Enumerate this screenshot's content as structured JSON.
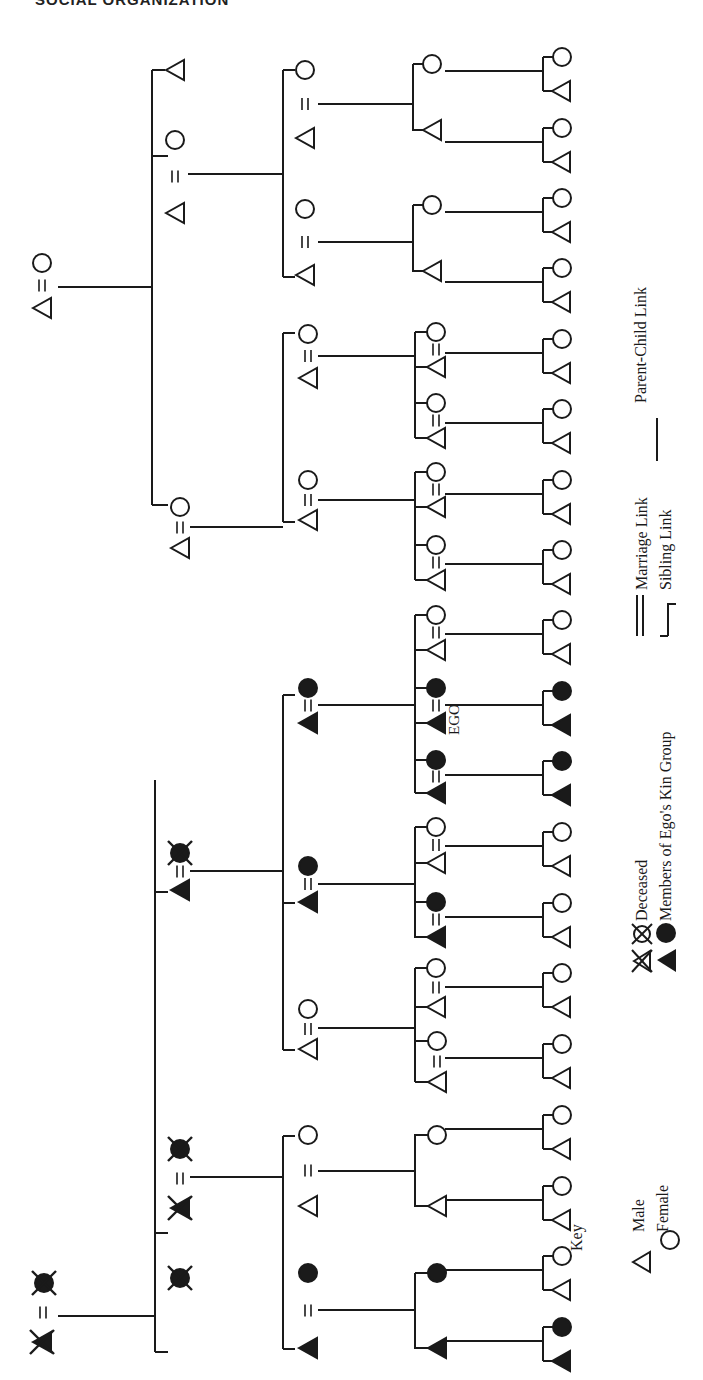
{
  "header": {
    "title": "SOCIAL ORGANIZATION"
  },
  "colors": {
    "ink": "#1a1a1a",
    "paper": "#ffffff"
  },
  "figure": {
    "orientation": "rotated-90-ccw",
    "ego_label": "EGO",
    "links": {
      "marriage": "=",
      "sibling": "bracket",
      "parent_child": "line"
    }
  },
  "legend": {
    "key_label": "Key",
    "male_label": "Male",
    "female_label": "Female",
    "deceased_label": "Deceased",
    "kin_group_label": "Members of Ego's Kin Group",
    "marriage_link_label": "Marriage Link",
    "sibling_link_label": "Sibling Link",
    "parent_child_link_label": "Parent-Child Link"
  },
  "nodes": [
    {
      "id": "g0a-m",
      "x": 42,
      "y": 1342,
      "shape": "triangle",
      "filled": true,
      "deceased": true
    },
    {
      "id": "g0a-f",
      "x": 44,
      "y": 1283,
      "shape": "circle",
      "filled": true,
      "deceased": true
    },
    {
      "id": "g0b-m",
      "x": 42,
      "y": 308,
      "shape": "triangle",
      "filled": false,
      "deceased": false
    },
    {
      "id": "g0b-f",
      "x": 42,
      "y": 263,
      "shape": "circle",
      "filled": false,
      "deceased": false
    },
    {
      "id": "g1-1",
      "x": 180,
      "y": 1278,
      "shape": "circle",
      "filled": true,
      "deceased": true
    },
    {
      "id": "g1-2m",
      "x": 180,
      "y": 1208,
      "shape": "triangle",
      "filled": true,
      "deceased": true
    },
    {
      "id": "g1-2f",
      "x": 180,
      "y": 1149,
      "shape": "circle",
      "filled": true,
      "deceased": true
    },
    {
      "id": "g1-3m",
      "x": 180,
      "y": 890,
      "shape": "triangle",
      "filled": true,
      "deceased": false
    },
    {
      "id": "g1-3f",
      "x": 180,
      "y": 853,
      "shape": "circle",
      "filled": true,
      "deceased": true
    },
    {
      "id": "g1-4m",
      "x": 180,
      "y": 548,
      "shape": "triangle",
      "filled": false,
      "deceased": false
    },
    {
      "id": "g1-4f",
      "x": 180,
      "y": 507,
      "shape": "circle",
      "filled": false,
      "deceased": false
    },
    {
      "id": "g1-5m",
      "x": 175,
      "y": 213,
      "shape": "triangle",
      "filled": false,
      "deceased": false
    },
    {
      "id": "g1-5f",
      "x": 175,
      "y": 140,
      "shape": "circle",
      "filled": false,
      "deceased": false
    },
    {
      "id": "g1-6",
      "x": 175,
      "y": 70,
      "shape": "triangle",
      "filled": false,
      "deceased": false
    },
    {
      "id": "g2-1m",
      "x": 308,
      "y": 1348,
      "shape": "triangle",
      "filled": true,
      "deceased": false
    },
    {
      "id": "g2-1f",
      "x": 308,
      "y": 1273,
      "shape": "circle",
      "filled": true,
      "deceased": false
    },
    {
      "id": "g2-2m",
      "x": 308,
      "y": 1206,
      "shape": "triangle",
      "filled": false,
      "deceased": false
    },
    {
      "id": "g2-2f",
      "x": 308,
      "y": 1135,
      "shape": "circle",
      "filled": false,
      "deceased": false
    },
    {
      "id": "g2-3m",
      "x": 308,
      "y": 1049,
      "shape": "triangle",
      "filled": false,
      "deceased": false
    },
    {
      "id": "g2-3f",
      "x": 308,
      "y": 1009,
      "shape": "circle",
      "filled": false,
      "deceased": false
    },
    {
      "id": "g2-4m",
      "x": 308,
      "y": 902,
      "shape": "triangle",
      "filled": true,
      "deceased": false
    },
    {
      "id": "g2-4f",
      "x": 308,
      "y": 866,
      "shape": "circle",
      "filled": true,
      "deceased": false
    },
    {
      "id": "g2-5m",
      "x": 308,
      "y": 723,
      "shape": "triangle",
      "filled": true,
      "deceased": false
    },
    {
      "id": "g2-5f",
      "x": 308,
      "y": 688,
      "shape": "circle",
      "filled": true,
      "deceased": false
    },
    {
      "id": "g2-6m",
      "x": 308,
      "y": 520,
      "shape": "triangle",
      "filled": false,
      "deceased": false
    },
    {
      "id": "g2-6f",
      "x": 308,
      "y": 480,
      "shape": "circle",
      "filled": false,
      "deceased": false
    },
    {
      "id": "g2-7m",
      "x": 308,
      "y": 378,
      "shape": "triangle",
      "filled": false,
      "deceased": false
    },
    {
      "id": "g2-7f",
      "x": 308,
      "y": 334,
      "shape": "circle",
      "filled": false,
      "deceased": false
    },
    {
      "id": "g2-8m",
      "x": 305,
      "y": 275,
      "shape": "triangle",
      "filled": false,
      "deceased": false
    },
    {
      "id": "g2-8f",
      "x": 305,
      "y": 209,
      "shape": "circle",
      "filled": false,
      "deceased": false
    },
    {
      "id": "g2-9m",
      "x": 305,
      "y": 138,
      "shape": "triangle",
      "filled": false,
      "deceased": false
    },
    {
      "id": "g2-9f",
      "x": 305,
      "y": 70,
      "shape": "circle",
      "filled": false,
      "deceased": false
    },
    {
      "id": "g3-1",
      "x": 437,
      "y": 1348,
      "shape": "triangle",
      "filled": true,
      "deceased": false
    },
    {
      "id": "g3-2",
      "x": 437,
      "y": 1273,
      "shape": "circle",
      "filled": true,
      "deceased": false
    },
    {
      "id": "g3-3",
      "x": 437,
      "y": 1206,
      "shape": "triangle",
      "filled": false,
      "deceased": false
    },
    {
      "id": "g3-4",
      "x": 437,
      "y": 1135,
      "shape": "circle",
      "filled": false,
      "deceased": false
    },
    {
      "id": "g3-5m",
      "x": 437,
      "y": 1082,
      "shape": "triangle",
      "filled": false,
      "deceased": false
    },
    {
      "id": "g3-5f",
      "x": 437,
      "y": 1041,
      "shape": "circle",
      "filled": false,
      "deceased": false
    },
    {
      "id": "g3-6m",
      "x": 436,
      "y": 1007,
      "shape": "triangle",
      "filled": false,
      "deceased": false
    },
    {
      "id": "g3-6f",
      "x": 436,
      "y": 968,
      "shape": "circle",
      "filled": false,
      "deceased": false
    },
    {
      "id": "g3-7m",
      "x": 436,
      "y": 937,
      "shape": "triangle",
      "filled": true,
      "deceased": false
    },
    {
      "id": "g3-7f",
      "x": 436,
      "y": 902,
      "shape": "circle",
      "filled": true,
      "deceased": false
    },
    {
      "id": "g3-8m",
      "x": 436,
      "y": 863,
      "shape": "triangle",
      "filled": false,
      "deceased": false
    },
    {
      "id": "g3-8f",
      "x": 436,
      "y": 827,
      "shape": "circle",
      "filled": false,
      "deceased": false
    },
    {
      "id": "g3-9m",
      "x": 436,
      "y": 793,
      "shape": "triangle",
      "filled": true,
      "deceased": false
    },
    {
      "id": "g3-9f",
      "x": 436,
      "y": 760,
      "shape": "circle",
      "filled": true,
      "deceased": false
    },
    {
      "id": "g3-10m",
      "x": 436,
      "y": 723,
      "shape": "triangle",
      "filled": true,
      "deceased": false,
      "ego": true
    },
    {
      "id": "g3-10f",
      "x": 436,
      "y": 688,
      "shape": "circle",
      "filled": true,
      "deceased": false
    },
    {
      "id": "g3-11m",
      "x": 436,
      "y": 650,
      "shape": "triangle",
      "filled": false,
      "deceased": false
    },
    {
      "id": "g3-11f",
      "x": 436,
      "y": 615,
      "shape": "circle",
      "filled": false,
      "deceased": false
    },
    {
      "id": "g3-12m",
      "x": 436,
      "y": 580,
      "shape": "triangle",
      "filled": false,
      "deceased": false
    },
    {
      "id": "g3-12f",
      "x": 436,
      "y": 545,
      "shape": "circle",
      "filled": false,
      "deceased": false
    },
    {
      "id": "g3-13m",
      "x": 436,
      "y": 507,
      "shape": "triangle",
      "filled": false,
      "deceased": false
    },
    {
      "id": "g3-13f",
      "x": 436,
      "y": 472,
      "shape": "circle",
      "filled": false,
      "deceased": false
    },
    {
      "id": "g3-14m",
      "x": 436,
      "y": 438,
      "shape": "triangle",
      "filled": false,
      "deceased": false
    },
    {
      "id": "g3-14f",
      "x": 436,
      "y": 403,
      "shape": "circle",
      "filled": false,
      "deceased": false
    },
    {
      "id": "g3-15m",
      "x": 436,
      "y": 367,
      "shape": "triangle",
      "filled": false,
      "deceased": false
    },
    {
      "id": "g3-15f",
      "x": 436,
      "y": 332,
      "shape": "circle",
      "filled": false,
      "deceased": false
    },
    {
      "id": "g3-16",
      "x": 432,
      "y": 271,
      "shape": "triangle",
      "filled": false,
      "deceased": false
    },
    {
      "id": "g3-17",
      "x": 432,
      "y": 205,
      "shape": "circle",
      "filled": false,
      "deceased": false
    },
    {
      "id": "g3-18",
      "x": 432,
      "y": 130,
      "shape": "triangle",
      "filled": false,
      "deceased": false
    },
    {
      "id": "g3-19",
      "x": 432,
      "y": 64,
      "shape": "circle",
      "filled": false,
      "deceased": false
    }
  ],
  "gen4_pairs": [
    {
      "y": 1349,
      "filled": true
    },
    {
      "y": 1278,
      "filled": false
    },
    {
      "y": 1208,
      "filled": false
    },
    {
      "y": 1137,
      "filled": false
    },
    {
      "y": 1066,
      "filled": false
    },
    {
      "y": 995,
      "filled": false
    },
    {
      "y": 925,
      "filled": false
    },
    {
      "y": 854,
      "filled": false
    },
    {
      "y": 783,
      "filled": true
    },
    {
      "y": 713,
      "filled": true
    },
    {
      "y": 642,
      "filled": false
    },
    {
      "y": 572,
      "filled": false
    },
    {
      "y": 502,
      "filled": false
    },
    {
      "y": 431,
      "filled": false
    },
    {
      "y": 361,
      "filled": false
    },
    {
      "y": 290,
      "filled": false
    },
    {
      "y": 220,
      "filled": false
    },
    {
      "y": 150,
      "filled": false
    },
    {
      "y": 79,
      "filled": false
    }
  ]
}
